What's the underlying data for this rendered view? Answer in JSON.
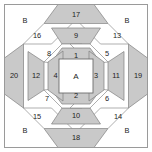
{
  "diagram": {
    "shape": "octagon",
    "colors": {
      "shaded_fill": "#c9c9c9",
      "light_fill": "#ffffff",
      "piece_outline": "#808080",
      "frame_outline": "#9a9a9a",
      "label_text": "#1d1d1d",
      "background": "#ffffff"
    },
    "center": {
      "label": "A",
      "fill": "light"
    },
    "corners": [
      {
        "label": "B",
        "position": "top-left",
        "fill": "light"
      },
      {
        "label": "B",
        "position": "top-right",
        "fill": "light"
      },
      {
        "label": "B",
        "position": "bottom-left",
        "fill": "light"
      },
      {
        "label": "B",
        "position": "bottom-right",
        "fill": "light"
      }
    ],
    "pieces": [
      {
        "label": "1",
        "ring": 1,
        "side": "top",
        "fill": "shaded"
      },
      {
        "label": "2",
        "ring": 1,
        "side": "bottom",
        "fill": "shaded"
      },
      {
        "label": "3",
        "ring": 1,
        "side": "right",
        "fill": "shaded"
      },
      {
        "label": "4",
        "ring": 1,
        "side": "left",
        "fill": "shaded"
      },
      {
        "label": "5",
        "ring": 2,
        "side": "top-right",
        "fill": "light"
      },
      {
        "label": "6",
        "ring": 2,
        "side": "bottom-right",
        "fill": "light"
      },
      {
        "label": "7",
        "ring": 2,
        "side": "bottom-left",
        "fill": "light"
      },
      {
        "label": "8",
        "ring": 2,
        "side": "top-left",
        "fill": "light"
      },
      {
        "label": "9",
        "ring": 3,
        "side": "top",
        "fill": "shaded"
      },
      {
        "label": "10",
        "ring": 3,
        "side": "bottom",
        "fill": "shaded"
      },
      {
        "label": "11",
        "ring": 3,
        "side": "right",
        "fill": "shaded"
      },
      {
        "label": "12",
        "ring": 3,
        "side": "left",
        "fill": "shaded"
      },
      {
        "label": "13",
        "ring": 4,
        "side": "top-right",
        "fill": "light"
      },
      {
        "label": "14",
        "ring": 4,
        "side": "bottom-right",
        "fill": "light"
      },
      {
        "label": "15",
        "ring": 4,
        "side": "bottom-left",
        "fill": "light"
      },
      {
        "label": "16",
        "ring": 4,
        "side": "top-left",
        "fill": "light"
      },
      {
        "label": "17",
        "ring": 5,
        "side": "top",
        "fill": "shaded"
      },
      {
        "label": "18",
        "ring": 5,
        "side": "bottom",
        "fill": "shaded"
      },
      {
        "label": "19",
        "ring": 5,
        "side": "right",
        "fill": "shaded"
      },
      {
        "label": "20",
        "ring": 5,
        "side": "left",
        "fill": "shaded"
      }
    ]
  }
}
